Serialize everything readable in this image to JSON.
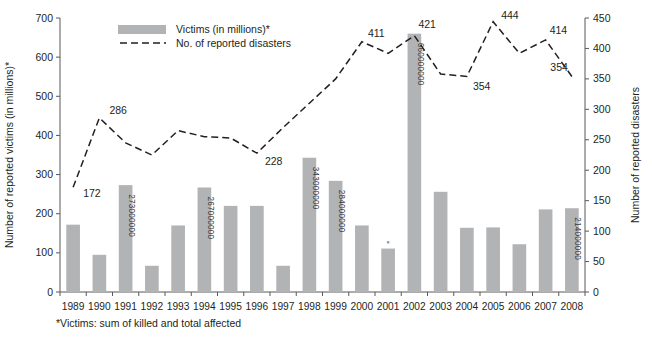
{
  "chart_data": {
    "type": "bar",
    "title": "",
    "subtitle": "",
    "xlabel": "",
    "ylabel": "Number of reported victims (in millions)*",
    "y2label": "Number of reported disasters",
    "ylim": [
      0,
      700
    ],
    "y2lim": [
      0,
      450
    ],
    "grid": false,
    "legend_position": "top-center",
    "x": [
      "1989",
      "1990",
      "1991",
      "1992",
      "1993",
      "1994",
      "1995",
      "1996",
      "1997",
      "1998",
      "1999",
      "2000",
      "2001",
      "2002",
      "2003",
      "2004",
      "2005",
      "2006",
      "2007",
      "2008"
    ],
    "categories": [
      "1989",
      "1990",
      "1991",
      "1992",
      "1993",
      "1994",
      "1995",
      "1996",
      "1997",
      "1998",
      "1999",
      "2000",
      "2001",
      "2002",
      "2003",
      "2004",
      "2005",
      "2006",
      "2007",
      "2008"
    ],
    "yticks": [
      0,
      100,
      200,
      300,
      400,
      500,
      600,
      700
    ],
    "y2ticks": [
      0,
      50,
      100,
      150,
      200,
      250,
      300,
      350,
      400,
      450
    ],
    "series": [
      {
        "name": "Victims (in millions)*",
        "type": "bar",
        "axis": "left",
        "color": "#b2b3b5",
        "values": [
          172,
          95,
          273,
          67,
          170,
          267,
          220,
          220,
          67,
          343,
          284,
          170,
          111,
          660,
          256,
          164,
          165,
          122,
          211,
          214
        ],
        "value_labels": [
          "",
          "",
          "273000000",
          "",
          "",
          "267000000",
          "",
          "",
          "",
          "343000000",
          "284000000",
          "",
          "",
          "660000000",
          "",
          "",
          "",
          "",
          "",
          "214000000"
        ]
      },
      {
        "name": "No. of reported disasters",
        "type": "line",
        "axis": "right",
        "color": "#231f20",
        "style": "dashed",
        "values": [
          172,
          286,
          245,
          225,
          265,
          255,
          253,
          228,
          270,
          310,
          350,
          411,
          392,
          421,
          358,
          354,
          444,
          392,
          414,
          354
        ],
        "point_labels": [
          "172",
          "286",
          "",
          "",
          "",
          "",
          "",
          "228",
          "",
          "",
          "",
          "411",
          "",
          "421",
          "",
          "354",
          "444",
          "",
          "414",
          "354"
        ]
      }
    ],
    "annotations": [
      {
        "text": "*Victims: sum of killed and total affected",
        "position": "below-axis-left"
      }
    ]
  },
  "legend": {
    "items": [
      {
        "label": "Victims (in millions)*",
        "marker": "swatch",
        "color": "#b2b3b5"
      },
      {
        "label": "No. of reported disasters",
        "marker": "dashed-line",
        "color": "#231f20"
      }
    ]
  },
  "axes": {
    "left_title": "Number of reported victims (in millions)*",
    "right_title": "Number of reported disasters"
  },
  "footnote": "*Victims: sum of killed and total affected"
}
